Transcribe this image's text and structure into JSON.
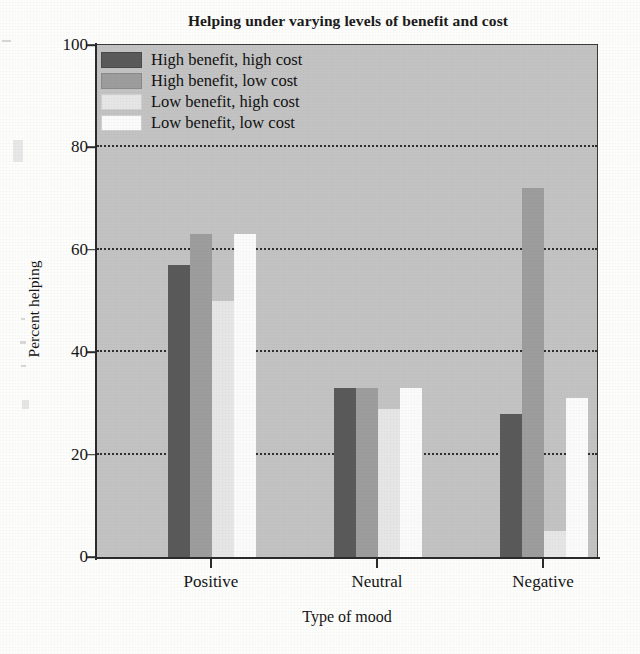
{
  "figure": {
    "title": "Helping under varying levels of benefit and cost",
    "x_axis_title": "Type of mood",
    "y_axis_title": "Percent helping"
  },
  "legend": {
    "items": [
      {
        "label": "High benefit, high cost",
        "color": "#5a5a5a",
        "swatch_name": "legend-swatch-high-benefit-high-cost"
      },
      {
        "label": "High benefit, low cost",
        "color": "#9d9d9d",
        "swatch_name": "legend-swatch-high-benefit-low-cost"
      },
      {
        "label": "Low benefit, high cost",
        "color": "#e6e6e6",
        "swatch_name": "legend-swatch-low-benefit-high-cost"
      },
      {
        "label": "Low benefit, low cost",
        "color": "#fbfbfb",
        "swatch_name": "legend-swatch-low-benefit-low-cost"
      }
    ]
  },
  "chart_data": {
    "type": "bar",
    "title": "Helping under varying levels of benefit and cost",
    "xlabel": "Type of mood",
    "ylabel": "Percent helping",
    "categories": [
      "Positive",
      "Neutral",
      "Negative"
    ],
    "series": [
      {
        "name": "High benefit, high cost",
        "color": "#5a5a5a",
        "values": [
          57,
          33,
          28
        ]
      },
      {
        "name": "High benefit, low cost",
        "color": "#9d9d9d",
        "values": [
          63,
          33,
          72
        ]
      },
      {
        "name": "Low benefit, high cost",
        "color": "#e6e6e6",
        "values": [
          50,
          29,
          5
        ]
      },
      {
        "name": "Low benefit, low cost",
        "color": "#fbfbfb",
        "values": [
          63,
          33,
          31
        ]
      }
    ],
    "ylim": [
      0,
      100
    ],
    "yticks": [
      0,
      20,
      40,
      60,
      80,
      100
    ],
    "ytick_labels": [
      "0",
      "20",
      "40",
      "60",
      "80",
      "100"
    ],
    "grid": true,
    "grid_style": "dotted-horizontal",
    "legend_position": "upper-left-inside",
    "plot_background": "#c3c3c3"
  }
}
